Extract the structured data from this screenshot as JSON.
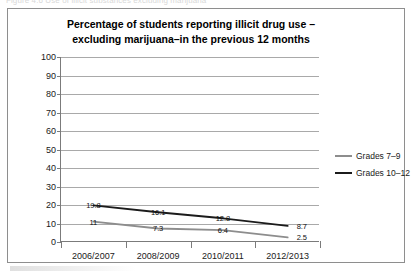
{
  "scan": {
    "caption_fragment": "Figure 4.6  Use of illicit substances excluding marijuana",
    "smudge_name": "scan-artifact"
  },
  "chart_data": {
    "type": "line",
    "title": "Percentage of students reporting illicit drug use – excluding marijuana–in the previous 12 months",
    "title_lines": [
      "Percentage of students reporting illicit drug use –",
      "excluding marijuana–in the previous 12 months"
    ],
    "xlabel": "",
    "ylabel": "",
    "categories": [
      "2006/2007",
      "2008/2009",
      "2010/2011",
      "2012/2013"
    ],
    "ylim": [
      0,
      100
    ],
    "yticks": [
      0,
      10,
      20,
      30,
      40,
      50,
      60,
      70,
      80,
      90,
      100
    ],
    "ytick_labels": [
      "0",
      "10",
      "20",
      "30",
      "40",
      "50",
      "60",
      "70",
      "80",
      "90",
      "100"
    ],
    "grid": true,
    "grid_axis": "y",
    "legend_position": "right",
    "series": [
      {
        "name": "Grades 10–12",
        "color": "#1b1b1b",
        "values": [
          19.8,
          16.1,
          12.8,
          8.7
        ],
        "point_labels": [
          "19.8",
          "16.1",
          "12.8",
          "8.7"
        ]
      },
      {
        "name": "Grades 7–9",
        "color": "#8d8d8d",
        "values": [
          11,
          7.3,
          6.4,
          2.5
        ],
        "point_labels": [
          "11",
          "7.3",
          "6.4",
          "2.5"
        ]
      }
    ],
    "legend": [
      {
        "label": "Grades 7–9",
        "color": "#8d8d8d"
      },
      {
        "label": "Grades 10–12",
        "color": "#1b1b1b"
      }
    ]
  },
  "colors": {
    "frame": "#8e8e8e",
    "axis": "#7b7b7b",
    "grid": "#a9a9a9",
    "series_dark": "#1b1b1b",
    "series_light": "#8d8d8d",
    "text": "#1a1a1a"
  }
}
